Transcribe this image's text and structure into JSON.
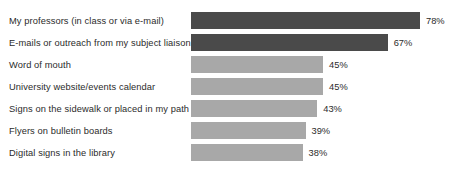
{
  "chart_data": {
    "type": "bar",
    "orientation": "horizontal",
    "title": "",
    "subtitle": "",
    "xlabel": "",
    "ylabel": "",
    "grid": false,
    "legend": false,
    "axis_visible": false,
    "value_suffix": "%",
    "xlim": [
      0,
      78
    ],
    "categories": [
      "My professors (in class or via e-mail)",
      "E-mails or outreach from my subject liaison",
      "Word of mouth",
      "University website/events calendar",
      "Signs on the sidewalk or placed in my path",
      "Flyers on bulletin boards",
      "Digital signs in the library"
    ],
    "values": [
      78,
      67,
      45,
      45,
      43,
      39,
      38
    ],
    "value_labels": [
      "78%",
      "67%",
      "45%",
      "45%",
      "43%",
      "39%",
      "38%"
    ],
    "bar_colors": [
      "#4a4a4a",
      "#4a4a4a",
      "#a8a8a8",
      "#a8a8a8",
      "#a8a8a8",
      "#a8a8a8",
      "#a8a8a8"
    ],
    "color_groups": {
      "highlight": "#4a4a4a",
      "standard": "#a8a8a8"
    },
    "background_color": "#ffffff",
    "text_color": "#2b2b2b"
  }
}
